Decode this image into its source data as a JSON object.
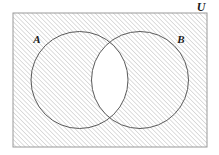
{
  "figure": {
    "type": "venn-diagram-two-sets",
    "caption_labels": {
      "universe": "U",
      "set_a": "A",
      "set_b": "B"
    },
    "shaded_description": "complement of A intersect B",
    "colors": {
      "background": "#ffffff",
      "hatch_line": "#b4b4b4",
      "rect_border": "#9a9a9a",
      "circle_stroke": "#5a5a5a",
      "label_text": "#1a1a1a",
      "unshaded_region": "#ffffff"
    },
    "geometry": {
      "canvas_width": 219,
      "canvas_height": 155,
      "rect": {
        "x": 13,
        "y": 13,
        "width": 194,
        "height": 134
      },
      "circle_a": {
        "cx": 79.5,
        "cy": 80,
        "r": 48.5
      },
      "circle_b": {
        "cx": 140,
        "cy": 80,
        "r": 48.5
      },
      "lens": {
        "x_min": 99,
        "x_max": 128,
        "y_min": 52,
        "y_max": 110
      },
      "hatch_spacing": 3.2,
      "hatch_angle_deg": 45
    },
    "label_positions": {
      "universe": {
        "x": 201,
        "y": 11
      },
      "set_a": {
        "x": 37,
        "y": 43
      },
      "set_b": {
        "x": 181,
        "y": 43
      }
    }
  }
}
